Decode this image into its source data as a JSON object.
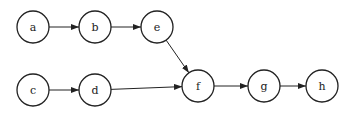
{
  "diagram": {
    "type": "directed-graph",
    "nodes": [
      {
        "id": "a",
        "label": "a",
        "x": 33,
        "y": 27
      },
      {
        "id": "b",
        "label": "b",
        "x": 95,
        "y": 27
      },
      {
        "id": "e",
        "label": "e",
        "x": 157,
        "y": 27
      },
      {
        "id": "c",
        "label": "c",
        "x": 33,
        "y": 90
      },
      {
        "id": "d",
        "label": "d",
        "x": 95,
        "y": 90
      },
      {
        "id": "f",
        "label": "f",
        "x": 198,
        "y": 86
      },
      {
        "id": "g",
        "label": "g",
        "x": 264,
        "y": 86
      },
      {
        "id": "h",
        "label": "h",
        "x": 322,
        "y": 86
      }
    ],
    "edges": [
      {
        "from": "a",
        "to": "b"
      },
      {
        "from": "b",
        "to": "e"
      },
      {
        "from": "e",
        "to": "f"
      },
      {
        "from": "c",
        "to": "d"
      },
      {
        "from": "d",
        "to": "f"
      },
      {
        "from": "f",
        "to": "g"
      },
      {
        "from": "g",
        "to": "h"
      }
    ],
    "colors": {
      "stroke": "#222222",
      "fill": "#ffffff"
    }
  }
}
